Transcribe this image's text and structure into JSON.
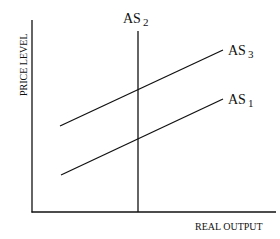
{
  "chart_data": {
    "type": "line",
    "title": "",
    "xlabel": "REAL OUTPUT",
    "ylabel": "PRICE LEVEL",
    "grid": false,
    "legend": "inline labels at line ends",
    "series": [
      {
        "name": "AS 1",
        "label_main": "AS",
        "label_sub": "1",
        "kind": "upward-sloping",
        "points": [
          [
            61,
            175
          ],
          [
            223,
            99
          ]
        ]
      },
      {
        "name": "AS 2",
        "label_main": "AS",
        "label_sub": "2",
        "kind": "vertical",
        "points": [
          [
            138,
            31
          ],
          [
            138,
            212
          ]
        ]
      },
      {
        "name": "AS 3",
        "label_main": "AS",
        "label_sub": "3",
        "kind": "upward-sloping",
        "points": [
          [
            60,
            126
          ],
          [
            223,
            50
          ]
        ]
      }
    ],
    "axes": {
      "origin": [
        32,
        212
      ],
      "y_top": 20,
      "x_right": 276
    }
  },
  "colors": {
    "line": "#111111",
    "background": "#ffffff"
  }
}
